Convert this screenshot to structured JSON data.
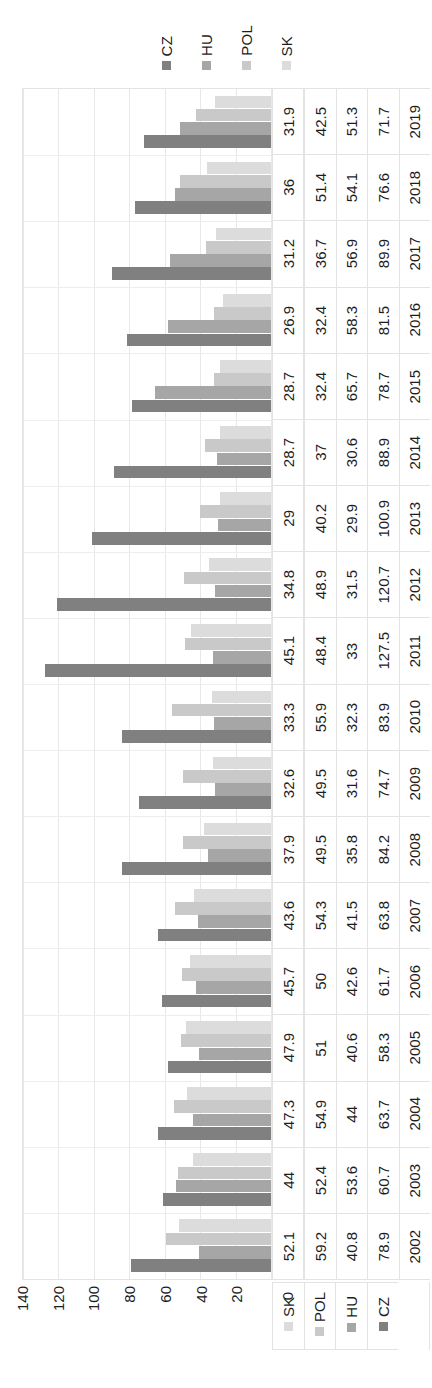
{
  "chart_data": {
    "type": "bar",
    "orientation": "rotated-horizontal",
    "title": "",
    "subtitle": "",
    "xlabel": "",
    "ylabel": "",
    "value_axis_range": [
      0,
      140
    ],
    "value_axis_ticks": [
      140,
      120,
      100,
      80,
      60,
      40,
      20,
      0
    ],
    "tick_step": 20,
    "grid": true,
    "legend_position": "top",
    "category_axis_label": "",
    "categories": [
      "2019",
      "2018",
      "2017",
      "2016",
      "2015",
      "2014",
      "2013",
      "2012",
      "2011",
      "2010",
      "2009",
      "2008",
      "2007",
      "2006",
      "2005",
      "2004",
      "2003",
      "2002"
    ],
    "series": [
      {
        "name": "CZ",
        "color": "#808080",
        "values": [
          71.7,
          76.6,
          89.9,
          81.5,
          78.7,
          88.9,
          100.9,
          120.7,
          127.5,
          83.9,
          74.7,
          84.2,
          63.8,
          61.7,
          58.3,
          63.7,
          60.7,
          78.9
        ],
        "labels": [
          "71.7",
          "76.6",
          "89.9",
          "81.5",
          "78.7",
          "88.9",
          "100.9",
          "120.7",
          "127.5",
          "83.9",
          "74.7",
          "84.2",
          "63.8",
          "61.7",
          "58.3",
          "63.7",
          "60.7",
          "78.9"
        ]
      },
      {
        "name": "HU",
        "color": "#a6a6a6",
        "values": [
          51.3,
          54.1,
          56.9,
          58.3,
          65.7,
          30.6,
          29.9,
          31.5,
          33,
          32.3,
          31.6,
          35.8,
          41.5,
          42.6,
          40.6,
          44,
          53.6,
          40.8
        ],
        "labels": [
          "51.3",
          "54.1",
          "56.9",
          "58.3",
          "65.7",
          "30.6",
          "29.9",
          "31.5",
          "33",
          "32.3",
          "31.6",
          "35.8",
          "41.5",
          "42.6",
          "40.6",
          "44",
          "53.6",
          "40.8"
        ]
      },
      {
        "name": "POL",
        "color": "#c9c9c9",
        "values": [
          42.5,
          51.4,
          36.7,
          32.4,
          32.4,
          37,
          40.2,
          48.9,
          48.4,
          55.9,
          49.5,
          49.5,
          54.3,
          50,
          51,
          54.9,
          52.4,
          59.2
        ],
        "labels": [
          "42.5",
          "51.4",
          "36.7",
          "32.4",
          "32.4",
          "37",
          "40.2",
          "48.9",
          "48.4",
          "55.9",
          "49.5",
          "49.5",
          "54.3",
          "50",
          "51",
          "54.9",
          "52.4",
          "59.2"
        ]
      },
      {
        "name": "SK",
        "color": "#dcdcdc",
        "values": [
          31.9,
          36,
          31.2,
          26.9,
          28.7,
          28.7,
          29,
          34.8,
          45.1,
          33.3,
          32.6,
          37.9,
          43.6,
          45.7,
          47.9,
          47.3,
          44,
          52.1
        ],
        "labels": [
          "31.9",
          "36",
          "31.2",
          "26.9",
          "28.7",
          "28.7",
          "29",
          "34.8",
          "45.1",
          "33.3",
          "32.6",
          "37.9",
          "43.6",
          "45.7",
          "47.9",
          "47.3",
          "44",
          "52.1"
        ]
      }
    ]
  },
  "legend": {
    "items": [
      {
        "label": "CZ",
        "color": "#808080"
      },
      {
        "label": "HU",
        "color": "#a6a6a6"
      },
      {
        "label": "POL",
        "color": "#c9c9c9"
      },
      {
        "label": "SK",
        "color": "#dcdcdc"
      }
    ]
  },
  "table": {
    "series_header": [
      "CZ",
      "HU",
      "POL",
      "SK"
    ],
    "year_header": ""
  }
}
